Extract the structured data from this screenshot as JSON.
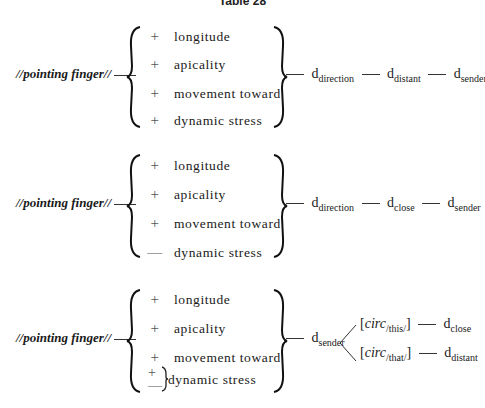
{
  "title": "Table 28",
  "diagrams": [
    {
      "lhs": "//pointing finger//",
      "features": [
        {
          "sign": "+",
          "label": "longitude"
        },
        {
          "sign": "+",
          "label": "apicality"
        },
        {
          "sign": "+",
          "label": "movement toward"
        },
        {
          "sign": "+",
          "label": "dynamic stress"
        }
      ],
      "chain": [
        {
          "base": "d",
          "sub": "direction"
        },
        {
          "base": "d",
          "sub": "distant"
        },
        {
          "base": "d",
          "sub": "sender"
        }
      ]
    },
    {
      "lhs": "//pointing finger//",
      "features": [
        {
          "sign": "+",
          "label": "longitude"
        },
        {
          "sign": "+",
          "label": "apicality"
        },
        {
          "sign": "+",
          "label": "movement toward"
        },
        {
          "sign": "—",
          "label": "dynamic stress"
        }
      ],
      "chain": [
        {
          "base": "d",
          "sub": "direction"
        },
        {
          "base": "d",
          "sub": "close"
        },
        {
          "base": "d",
          "sub": "sender"
        }
      ]
    },
    {
      "lhs": "//pointing finger//",
      "features": [
        {
          "sign": "+",
          "label": "longitude"
        },
        {
          "sign": "+",
          "label": "apicality"
        },
        {
          "sign": "+",
          "label": "movement toward"
        },
        {
          "sign": "±",
          "label": "dynamic stress",
          "signs": [
            "+",
            "—"
          ]
        }
      ],
      "chain": [
        {
          "base": "d",
          "sub": "sender"
        }
      ],
      "branches": [
        {
          "circ": "circ",
          "circ_sub": "/this/",
          "result": {
            "base": "d",
            "sub": "close"
          }
        },
        {
          "circ": "circ",
          "circ_sub": "/that/",
          "result": {
            "base": "d",
            "sub": "distant"
          }
        }
      ]
    }
  ]
}
